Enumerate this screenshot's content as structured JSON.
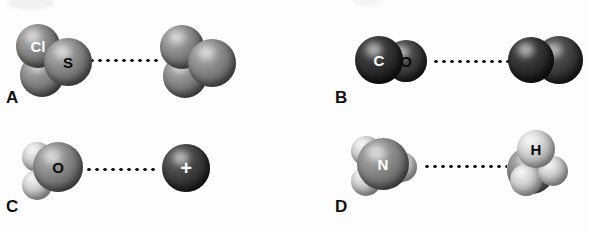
{
  "figure": {
    "type": "molecular-interaction-diagram",
    "panel_count": 4,
    "style": "grayscale space-filling models",
    "background_color": "#fdfdfd"
  },
  "panels": [
    {
      "label": "A",
      "left_molecule": {
        "name": "sulfur-dichloride",
        "geometry": "bent",
        "atoms": [
          {
            "symbol": "Cl",
            "label_shown": "Cl",
            "label_color": "#ffffff",
            "shade": "mid"
          },
          {
            "symbol": "S",
            "label_shown": "S",
            "label_color": "#0a0a0a",
            "shade": "mid"
          },
          {
            "symbol": "Cl",
            "label_shown": "",
            "label_color": "",
            "shade": "mid"
          }
        ]
      },
      "interaction": {
        "style": "dotted",
        "dot_count": 12
      },
      "right_molecule": {
        "name": "sulfur-dichloride",
        "geometry": "bent",
        "atoms": [
          {
            "symbol": "Cl",
            "label_shown": "",
            "shade": "mid"
          },
          {
            "symbol": "S",
            "label_shown": "",
            "shade": "mid"
          },
          {
            "symbol": "Cl",
            "label_shown": "",
            "shade": "mid"
          }
        ]
      }
    },
    {
      "label": "B",
      "left_molecule": {
        "name": "carbon-monoxide",
        "geometry": "linear",
        "atoms": [
          {
            "symbol": "C",
            "label_shown": "C",
            "label_color": "#ffffff",
            "shade": "verydark"
          },
          {
            "symbol": "O",
            "label_shown": "O",
            "label_color": "#0a0a0a",
            "shade": "dark"
          }
        ]
      },
      "interaction": {
        "style": "dotted",
        "dot_count": 13
      },
      "right_molecule": {
        "name": "carbon-monoxide",
        "geometry": "linear",
        "atoms": [
          {
            "symbol": "C",
            "label_shown": "",
            "shade": "verydark"
          },
          {
            "symbol": "O",
            "label_shown": "",
            "shade": "dark"
          }
        ]
      }
    },
    {
      "label": "C",
      "left_molecule": {
        "name": "water",
        "geometry": "bent",
        "atoms": [
          {
            "symbol": "O",
            "label_shown": "O",
            "label_color": "#0a0a0a",
            "shade": "mid"
          },
          {
            "symbol": "H",
            "label_shown": "",
            "shade": "light"
          },
          {
            "symbol": "H",
            "label_shown": "",
            "shade": "light"
          }
        ]
      },
      "interaction": {
        "style": "dotted",
        "dot_count": 13
      },
      "right_molecule": {
        "name": "cation",
        "geometry": "monatomic",
        "charge_symbol": "+",
        "atoms": [
          {
            "symbol": "+",
            "label_shown": "+",
            "label_color": "#ffffff",
            "shade": "dark"
          }
        ]
      }
    },
    {
      "label": "D",
      "left_molecule": {
        "name": "ammonia",
        "geometry": "trigonal-pyramidal",
        "atoms": [
          {
            "symbol": "N",
            "label_shown": "N",
            "label_color": "#ffffff",
            "shade": "mid"
          },
          {
            "symbol": "H",
            "label_shown": "",
            "shade": "light"
          },
          {
            "symbol": "H",
            "label_shown": "",
            "shade": "light"
          },
          {
            "symbol": "H",
            "label_shown": "",
            "shade": "light"
          }
        ]
      },
      "interaction": {
        "style": "dotted",
        "dot_count": 13
      },
      "right_molecule": {
        "name": "ammonia",
        "geometry": "trigonal-pyramidal",
        "atoms": [
          {
            "symbol": "H",
            "label_shown": "H",
            "label_color": "#0a0a0a",
            "shade": "light"
          },
          {
            "symbol": "N",
            "label_shown": "",
            "shade": "mid"
          },
          {
            "symbol": "H",
            "label_shown": "",
            "shade": "light"
          },
          {
            "symbol": "H",
            "label_shown": "",
            "shade": "light"
          }
        ]
      }
    }
  ]
}
